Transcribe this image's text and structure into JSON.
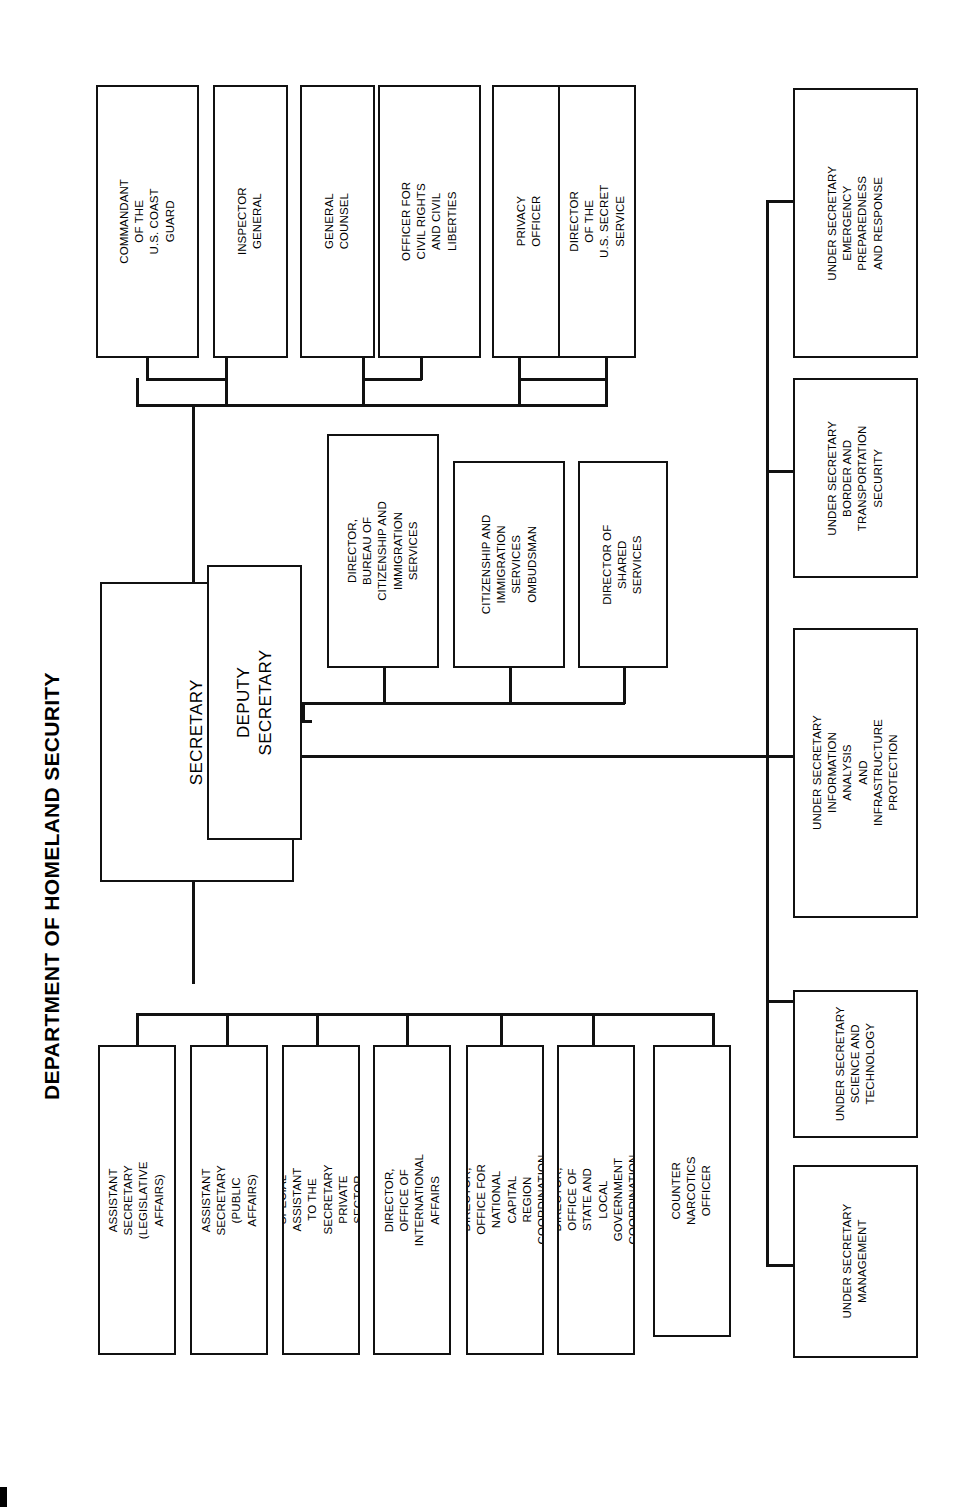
{
  "title": "DEPARTMENT OF HOMELAND SECURITY",
  "chart_data": {
    "type": "diagram",
    "orientation": "rotated-90-ccw",
    "root": "SECRETARY",
    "nodes": {
      "secretary": "SECRETARY",
      "deputy_secretary": "DEPUTY SECRETARY"
    },
    "groups": {
      "direct_reports_top": [
        "COMMANDANT OF THE\nU.S. COAST GUARD",
        "INSPECTOR GENERAL",
        "GENERAL COUNSEL",
        "OFFICER FOR CIVIL RIGHTS\nAND CIVIL LIBERTIES",
        "PRIVACY OFFICER",
        "DIRECTOR OF THE\nU.S. SECRET SERVICE"
      ],
      "deputy_secretary_reports": [
        "DIRECTOR, BUREAU OF\nCITIZENSHIP AND\nIMMIGRATION SERVICES",
        "CITIZENSHIP AND\nIMMIGRATION SERVICES\nOMBUDSMAN",
        "DIRECTOR OF SHARED\nSERVICES"
      ],
      "secretary_staff": [
        "ASSISTANT SECRETARY (LEGISLATIVE AFFAIRS)",
        "ASSISTANT SECRETARY (PUBLIC AFFAIRS)",
        "SPECIAL ASSISTANT TO THE SECRETARY\nPRIVATE SECTOR",
        "DIRECTOR, OFFICE OF INTERNATIONAL AFFAIRS",
        "DIRECTOR, OFFICE FOR NATIONAL CAPITAL\nREGION COORDINATION",
        "DIRECTOR, OFFICE OF STATE AND LOCAL\nGOVERNMENT COORDINATION",
        "COUNTER NARCOTICS OFFICER"
      ],
      "under_secretaries": [
        "UNDER SECRETARY\nEMERGENCY\nPREPAREDNESS\nAND RESPONSE",
        "UNDER SECRETARY\nBORDER AND\nTRANSPORTATION SECURITY",
        "UNDER SECRETARY\nINFORMATION ANALYSIS\nAND INFRASTRUCTURE\nPROTECTION",
        "UNDER SECRETARY\nSCIENCE AND TECHNOLOGY",
        "UNDER SECRETARY\nMANAGEMENT"
      ]
    },
    "colors": {
      "line": "#111111",
      "box_fill": "#ffffff",
      "text": "#000000"
    }
  }
}
